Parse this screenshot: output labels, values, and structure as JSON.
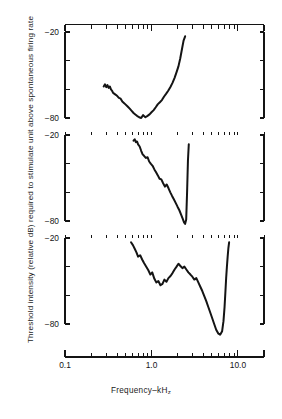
{
  "figure": {
    "axis_label_y": "Threshold intensity (relative dB) required to stimulate unit above spontaneous firing rate",
    "axis_label_x_main": "Frequency–kH",
    "axis_label_x_sub": "z"
  },
  "chart_data": {
    "type": "line",
    "title": "",
    "subtitle": "",
    "xlabel": "Frequency–kHz",
    "ylabel": "Threshold intensity (relative dB) required to stimulate unit above spontaneous firing rate",
    "xscale": "log",
    "xlim": [
      0.1,
      20.0
    ],
    "ylim": [
      -90,
      -14
    ],
    "grid": false,
    "legend": null,
    "xticks_major": [
      0.1,
      1.0,
      10.0
    ],
    "xticklabels": [
      "0.1",
      "1.0",
      "10.0"
    ],
    "xticks_minor": [
      0.2,
      0.3,
      0.4,
      0.5,
      0.6,
      0.7,
      0.8,
      0.9,
      2.0,
      3.0,
      4.0,
      5.0,
      6.0,
      7.0,
      8.0,
      9.0,
      20.0
    ],
    "yticks_major": [
      -20,
      -80
    ],
    "yticklabels": [
      "−20",
      "−80"
    ],
    "yticks_minor": [
      -40,
      -60
    ],
    "panels": [
      {
        "name": "panel-top",
        "ylabel_top": "−20",
        "ylabel_bottom": "−80",
        "series": [
          {
            "name": "tuning-curve-unit-1",
            "x": [
              0.28,
              0.29,
              0.3,
              0.31,
              0.32,
              0.33,
              0.34,
              0.35,
              0.36,
              0.38,
              0.4,
              0.42,
              0.44,
              0.46,
              0.48,
              0.5,
              0.53,
              0.56,
              0.59,
              0.62,
              0.65,
              0.68,
              0.72,
              0.76,
              0.8,
              0.85,
              0.9,
              0.95,
              1.0,
              1.06,
              1.12,
              1.18,
              1.25,
              1.32,
              1.4,
              1.48,
              1.56,
              1.65,
              1.75,
              1.85,
              1.95,
              2.05,
              2.15,
              2.25,
              2.35,
              2.45
            ],
            "y": [
              -58.0,
              -56.5,
              -58.5,
              -57.0,
              -59.0,
              -58.0,
              -60.0,
              -61.0,
              -62.5,
              -63.5,
              -64.5,
              -66.0,
              -66.5,
              -68.5,
              -69.5,
              -70.5,
              -72.0,
              -73.5,
              -75.0,
              -76.5,
              -77.5,
              -78.5,
              -79.5,
              -80.0,
              -78.0,
              -79.5,
              -78.5,
              -77.5,
              -76.0,
              -74.5,
              -72.5,
              -70.5,
              -69.0,
              -67.5,
              -65.0,
              -63.0,
              -61.0,
              -58.5,
              -55.5,
              -52.0,
              -48.0,
              -44.0,
              -38.5,
              -32.0,
              -26.0,
              -23.0
            ]
          }
        ]
      },
      {
        "name": "panel-middle",
        "ylabel_top": "−20",
        "ylabel_bottom": "−80",
        "series": [
          {
            "name": "tuning-curve-unit-2",
            "x": [
              0.62,
              0.64,
              0.66,
              0.68,
              0.7,
              0.73,
              0.76,
              0.79,
              0.82,
              0.86,
              0.9,
              0.94,
              0.98,
              1.03,
              1.08,
              1.13,
              1.18,
              1.24,
              1.3,
              1.36,
              1.43,
              1.5,
              1.57,
              1.65,
              1.73,
              1.82,
              1.91,
              2.0,
              2.1,
              2.2,
              2.3,
              2.38,
              2.45,
              2.52,
              2.58,
              2.64,
              2.7
            ],
            "y": [
              -24.0,
              -23.0,
              -25.0,
              -24.5,
              -26.5,
              -28.0,
              -31.0,
              -33.5,
              -34.5,
              -36.0,
              -35.5,
              -38.5,
              -40.0,
              -41.5,
              -44.0,
              -46.0,
              -48.0,
              -50.5,
              -51.0,
              -53.5,
              -56.0,
              -54.5,
              -57.0,
              -60.0,
              -62.5,
              -65.0,
              -67.5,
              -70.0,
              -72.5,
              -75.5,
              -78.5,
              -81.0,
              -82.0,
              -79.0,
              -60.0,
              -38.0,
              -26.5
            ]
          }
        ]
      },
      {
        "name": "panel-bottom",
        "ylabel_top": "−20",
        "ylabel_bottom": "−80",
        "series": [
          {
            "name": "tuning-curve-unit-3",
            "x": [
              0.58,
              0.61,
              0.64,
              0.67,
              0.7,
              0.74,
              0.78,
              0.82,
              0.87,
              0.92,
              0.97,
              1.02,
              1.08,
              1.14,
              1.2,
              1.27,
              1.34,
              1.41,
              1.49,
              1.57,
              1.66,
              1.75,
              1.85,
              1.95,
              2.05,
              2.16,
              2.28,
              2.4,
              2.53,
              2.67,
              2.82,
              2.97,
              3.13,
              3.3,
              3.48,
              3.67,
              3.87,
              4.08,
              4.3,
              4.53,
              4.78,
              5.04,
              5.31,
              5.6,
              5.9,
              6.22,
              6.56,
              6.8,
              7.0,
              7.15,
              7.3,
              7.45,
              7.6,
              7.75,
              7.9
            ],
            "y": [
              -23.0,
              -25.0,
              -27.5,
              -30.0,
              -33.0,
              -32.0,
              -35.0,
              -37.5,
              -40.0,
              -42.5,
              -45.5,
              -44.0,
              -48.5,
              -51.0,
              -50.0,
              -53.0,
              -52.0,
              -49.0,
              -50.5,
              -48.0,
              -46.5,
              -44.5,
              -42.0,
              -40.0,
              -38.0,
              -39.5,
              -41.0,
              -40.0,
              -42.0,
              -44.0,
              -45.5,
              -47.0,
              -49.0,
              -48.0,
              -51.0,
              -54.0,
              -57.0,
              -60.5,
              -64.0,
              -68.0,
              -72.0,
              -76.0,
              -80.0,
              -84.0,
              -86.5,
              -87.5,
              -85.0,
              -78.0,
              -68.0,
              -58.0,
              -48.0,
              -40.0,
              -33.0,
              -27.0,
              -23.0
            ]
          }
        ]
      }
    ]
  }
}
